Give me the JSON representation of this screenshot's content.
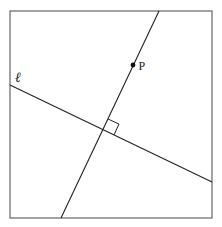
{
  "diagram": {
    "type": "geometry-perpendicular-lines",
    "frame": {
      "x1": 10,
      "y1": 11,
      "x2": 212,
      "y2": 218,
      "stroke": "#555555"
    },
    "lines": [
      {
        "id": "line-l",
        "label": "ℓ",
        "x1": 10,
        "y1": 85,
        "x2": 212,
        "y2": 182,
        "stroke": "#222222"
      },
      {
        "id": "perpendicular-through-p",
        "label": "",
        "x1": 159,
        "y1": 11,
        "x2": 61,
        "y2": 218,
        "stroke": "#222222"
      }
    ],
    "points": [
      {
        "id": "P",
        "label": "P",
        "x": 133,
        "y": 65
      }
    ],
    "intersection": {
      "x": 103,
      "y": 130
    },
    "right_angle_marker": {
      "points": [
        [
          108,
          119
        ],
        [
          119,
          124
        ],
        [
          114,
          135
        ]
      ]
    },
    "labels": {
      "line_label": "ℓ",
      "point_label": "P"
    }
  }
}
